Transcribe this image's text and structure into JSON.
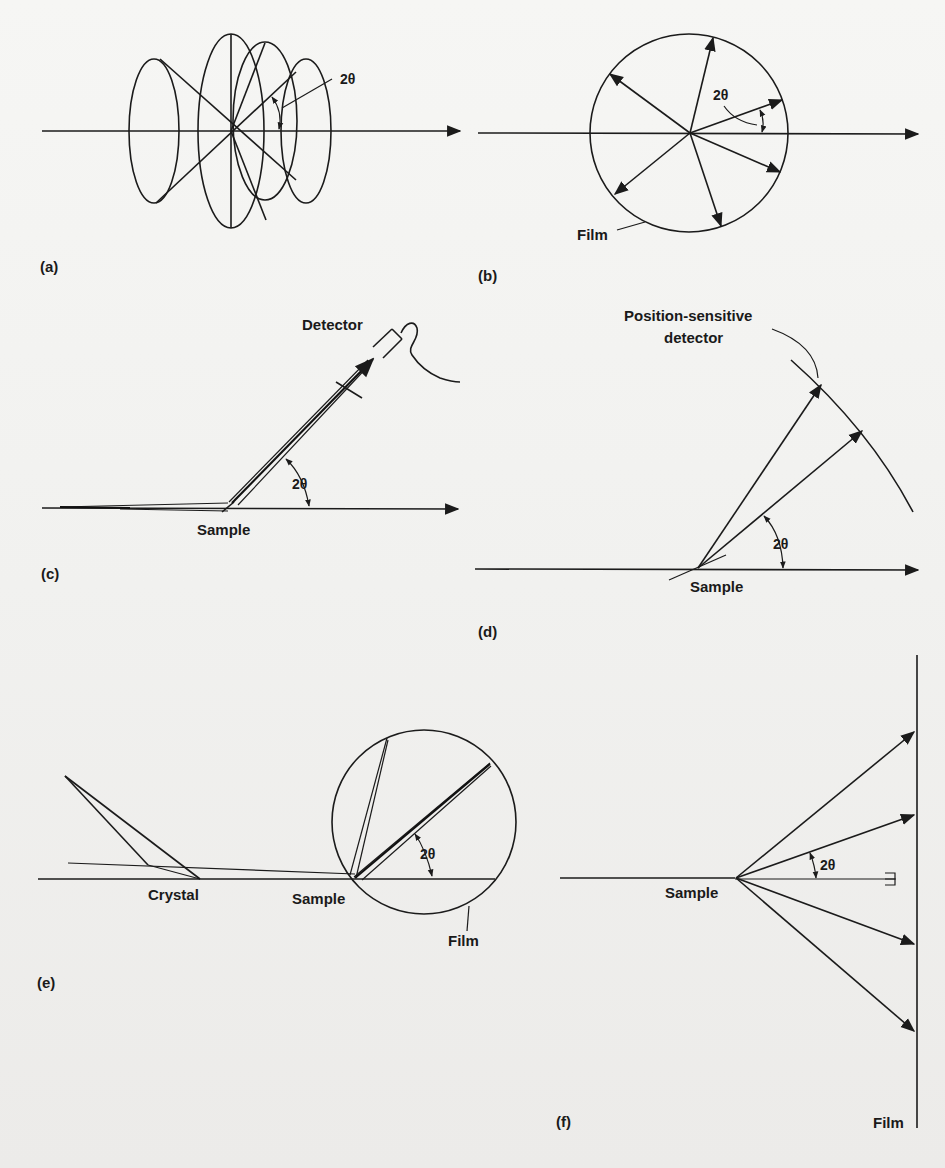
{
  "figure": {
    "panels": [
      {
        "id": "a",
        "label": "(a)",
        "angle_label": "2θ",
        "description": "Debye-Scherrer cones of diffracted radiation around the incident beam"
      },
      {
        "id": "b",
        "label": "(b)",
        "angle_label": "2θ",
        "callouts": [
          "Film"
        ],
        "description": "Cylindrical film camera cross-section with diffracted rays"
      },
      {
        "id": "c",
        "label": "(c)",
        "angle_label": "2θ",
        "callouts": [
          "Detector",
          "Sample"
        ],
        "description": "Diffractometer with scanning detector"
      },
      {
        "id": "d",
        "label": "(d)",
        "angle_label": "2θ",
        "callouts": [
          "Position-sensitive",
          "detector",
          "Sample"
        ],
        "description": "Position-sensitive detector arc"
      },
      {
        "id": "e",
        "label": "(e)",
        "angle_label": "2θ",
        "callouts": [
          "Crystal",
          "Sample",
          "Film"
        ],
        "description": "Focusing (Guinier) camera with monochromator crystal"
      },
      {
        "id": "f",
        "label": "(f)",
        "angle_label": "2θ",
        "callouts": [
          "Sample",
          "Film"
        ],
        "description": "Flat-film transmission geometry with beam stop"
      }
    ]
  },
  "labels": {
    "a_panel": "(a)",
    "a_angle": "2θ",
    "b_panel": "(b)",
    "b_angle": "2θ",
    "b_film": "Film",
    "c_panel": "(c)",
    "c_angle": "2θ",
    "c_detector": "Detector",
    "c_sample": "Sample",
    "d_panel": "(d)",
    "d_angle": "2θ",
    "d_psd_line1": "Position-sensitive",
    "d_psd_line2": "detector",
    "d_sample": "Sample",
    "e_panel": "(e)",
    "e_angle": "2θ",
    "e_crystal": "Crystal",
    "e_sample": "Sample",
    "e_film": "Film",
    "f_panel": "(f)",
    "f_angle": "2θ",
    "f_sample": "Sample",
    "f_film": "Film"
  },
  "colors": {
    "ink": "#1b1b1b",
    "paper": "#f4f4f2"
  }
}
